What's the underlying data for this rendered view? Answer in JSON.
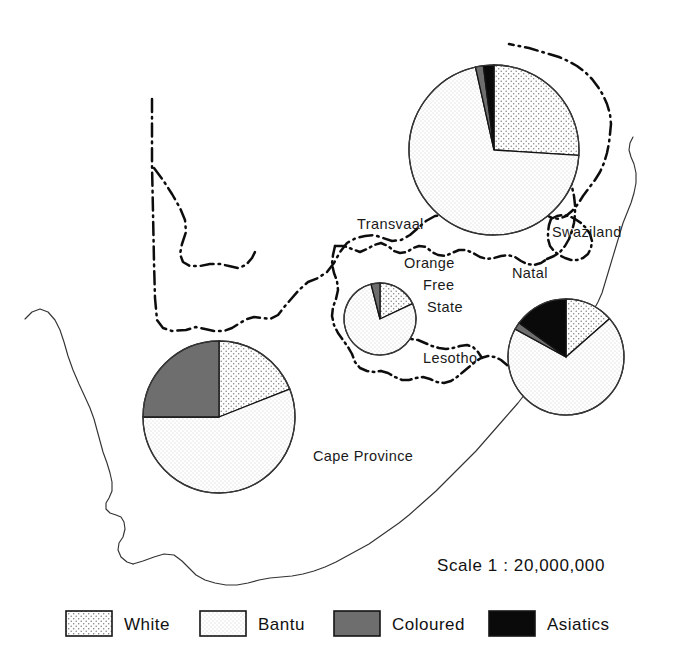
{
  "figure": {
    "scale_text": "Scale  1 : 20,000,000"
  },
  "colors": {
    "white_fill": "#ffffff",
    "white_dot": "#8a8a8a",
    "bantu_fill": "#ffffff",
    "bantu_dot": "#b8b8b8",
    "coloured": "#6e6e6e",
    "asiatics": "#0a0a0a",
    "outline": "#141414",
    "coastline": "#333333"
  },
  "map_labels": [
    {
      "name": "transvaal",
      "text": "Transvaal",
      "x": 357,
      "y": 229
    },
    {
      "name": "swaziland",
      "text": "Swaziland",
      "x": 552,
      "y": 237
    },
    {
      "name": "orange",
      "text": "Orange",
      "x": 404,
      "y": 268
    },
    {
      "name": "free",
      "text": "Free",
      "x": 423,
      "y": 290
    },
    {
      "name": "state",
      "text": "State",
      "x": 427,
      "y": 312
    },
    {
      "name": "natal",
      "text": "Natal",
      "x": 512,
      "y": 278
    },
    {
      "name": "lesotho",
      "text": "Lesotho",
      "x": 423,
      "y": 363
    },
    {
      "name": "cape-province",
      "text": "Cape Province",
      "x": 313,
      "y": 461
    }
  ],
  "legend": {
    "items": [
      {
        "key": "white",
        "label": "White",
        "swatch": "dots-dense",
        "x": 66
      },
      {
        "key": "bantu",
        "label": "Bantu",
        "swatch": "dots-light",
        "x": 200
      },
      {
        "key": "coloured",
        "label": "Coloured",
        "swatch": "solid-gray",
        "x": 334
      },
      {
        "key": "asiatics",
        "label": "Asiatics",
        "swatch": "solid-black",
        "x": 489
      }
    ]
  },
  "chart_data": {
    "type": "pie",
    "subtitle": "Scale  1 : 20,000,000",
    "legend": [
      "White",
      "Bantu",
      "Coloured",
      "Asiatics"
    ],
    "legend_position": "bottom",
    "value_unit": "percent of provincial population",
    "note": "Pie radius is proportional to total provincial population.",
    "charts": [
      {
        "name": "Transvaal",
        "cx": 494,
        "cy": 150,
        "r": 85,
        "categories": [
          "White",
          "Bantu",
          "Coloured",
          "Asiatics"
        ],
        "values": [
          26,
          70.5,
          1.5,
          2
        ],
        "start_angle_deg": 0,
        "direction": "clockwise"
      },
      {
        "name": "Orange Free State",
        "cx": 380,
        "cy": 319,
        "r": 36,
        "categories": [
          "White",
          "Bantu",
          "Coloured",
          "Asiatics"
        ],
        "values": [
          18,
          78,
          4,
          0
        ],
        "start_angle_deg": 0,
        "direction": "clockwise"
      },
      {
        "name": "Natal",
        "cx": 566,
        "cy": 357,
        "r": 58,
        "categories": [
          "White",
          "Bantu",
          "Coloured",
          "Asiatics"
        ],
        "values": [
          13.5,
          69.5,
          2,
          15
        ],
        "start_angle_deg": 0,
        "direction": "clockwise"
      },
      {
        "name": "Cape Province",
        "cx": 219,
        "cy": 417,
        "r": 76,
        "categories": [
          "White",
          "Bantu",
          "Coloured",
          "Asiatics"
        ],
        "values": [
          19,
          56,
          25,
          0
        ],
        "start_angle_deg": 0,
        "direction": "clockwise"
      }
    ]
  }
}
